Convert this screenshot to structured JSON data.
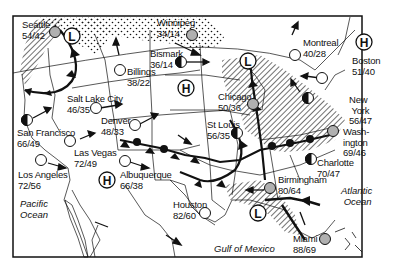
{
  "map": {
    "title": "U.S. Weather Map",
    "colors": {
      "ink": "#111111",
      "rain_gray": "#b0b0b0",
      "background": "#ffffff"
    },
    "cities": [
      {
        "name": "Seattle",
        "temps": "54/42",
        "symbol": "rain"
      },
      {
        "name": "Winnipeg",
        "temps": "34/14",
        "symbol": "rain"
      },
      {
        "name": "Bismark",
        "temps": "36/14",
        "symbol": "partly-cloudy"
      },
      {
        "name": "Billings",
        "temps": "38/22",
        "symbol": "clear"
      },
      {
        "name": "Montreal",
        "temps": "40/28",
        "symbol": "clear"
      },
      {
        "name": "Boston",
        "temps": "51/40",
        "symbol": "clear"
      },
      {
        "name": "Salt Lake City",
        "temps": "46/35",
        "symbol": "clear"
      },
      {
        "name": "Chicago",
        "temps": "50/36",
        "symbol": "rain"
      },
      {
        "name": "New York",
        "temps": "56/47",
        "symbol": "partly-cloudy"
      },
      {
        "name": "Denver",
        "temps": "48/33",
        "symbol": "clear"
      },
      {
        "name": "San Francisco",
        "temps": "66/49",
        "symbol": "partly-cloudy"
      },
      {
        "name": "St Louis",
        "temps": "56/35",
        "symbol": "partly-cloudy"
      },
      {
        "name": "Washington",
        "name_line1": "Wash-",
        "name_line2": "ington",
        "temps": "69/46",
        "symbol": "rain"
      },
      {
        "name": "Las Vegas",
        "temps": "72/49",
        "symbol": "clear"
      },
      {
        "name": "Charlotte",
        "temps": "70/47",
        "symbol": "partly-cloudy"
      },
      {
        "name": "Los Angeles",
        "temps": "72/56",
        "symbol": "clear"
      },
      {
        "name": "Albuquerque",
        "temps": "66/38",
        "symbol": "clear"
      },
      {
        "name": "Birmingham",
        "temps": "80/64",
        "symbol": "rain"
      },
      {
        "name": "Houston",
        "temps": "82/60",
        "symbol": "clear"
      },
      {
        "name": "Miami",
        "temps": "88/69",
        "symbol": "rain"
      }
    ],
    "pressure_systems": [
      {
        "type": "L",
        "label": "L",
        "location": "Pacific Northwest"
      },
      {
        "type": "L",
        "label": "L",
        "location": "Great Lakes"
      },
      {
        "type": "L",
        "label": "L",
        "location": "Gulf Coast"
      },
      {
        "type": "H",
        "label": "H",
        "location": "Northern Plains"
      },
      {
        "type": "H",
        "label": "H",
        "location": "New England"
      },
      {
        "type": "H",
        "label": "H",
        "location": "Southwest"
      }
    ],
    "water_bodies": [
      {
        "line1": "Pacific",
        "line2": "Ocean"
      },
      {
        "line1": "Atlantic",
        "line2": "Ocean"
      },
      {
        "line1": "Gulf of Mexico"
      }
    ]
  }
}
